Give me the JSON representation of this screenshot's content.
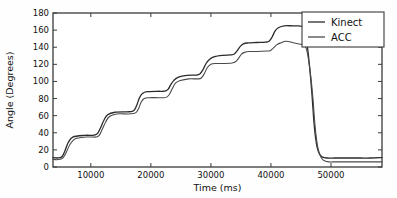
{
  "figure": {
    "background": "#fefefe",
    "axes_color": "#3a3a3a"
  },
  "chart_data": {
    "type": "line",
    "title": "",
    "xlabel": "Time (ms)",
    "ylabel": "Angle (Degrees)",
    "xlim": [
      3700,
      58500
    ],
    "ylim": [
      0,
      180
    ],
    "xticks": [
      10000,
      20000,
      30000,
      40000,
      50000
    ],
    "xtick_labels": [
      "10000",
      "20000",
      "30000",
      "40000",
      "50000"
    ],
    "yticks": [
      0,
      20,
      40,
      60,
      80,
      100,
      120,
      140,
      160,
      180
    ],
    "ytick_labels": [
      "0",
      "20",
      "40",
      "60",
      "80",
      "100",
      "120",
      "140",
      "160",
      "180"
    ],
    "grid": false,
    "legend_position": "upper right",
    "legend_entries": [
      "Kinect",
      "ACC"
    ],
    "series": [
      {
        "name": "Kinect",
        "color": "#2b2b2b",
        "width": 1.3,
        "x": [
          3700,
          4300,
          4900,
          5300,
          5700,
          6200,
          7000,
          9000,
          10200,
          10700,
          11200,
          11700,
          12200,
          12800,
          14000,
          16000,
          16900,
          17300,
          17700,
          18100,
          18600,
          19400,
          21000,
          22000,
          22500,
          22900,
          23300,
          23800,
          24600,
          26000,
          27600,
          28200,
          28700,
          29200,
          29800,
          30600,
          32000,
          33300,
          33900,
          34400,
          34900,
          35400,
          36200,
          37600,
          39100,
          39700,
          40200,
          40700,
          41300,
          42200,
          43600,
          44600,
          45100,
          45400,
          45700,
          46000,
          46400,
          46800,
          47100,
          47400,
          47700,
          48100,
          48600,
          49400,
          50600,
          52000,
          53500,
          55000,
          56500,
          58500
        ],
        "y": [
          11,
          10.5,
          11,
          13,
          19,
          28,
          35,
          37,
          37,
          37.5,
          40,
          47,
          55,
          61,
          64,
          64.5,
          65,
          67,
          73,
          81,
          86,
          88,
          88.5,
          88.5,
          89,
          91,
          96,
          101,
          105,
          107,
          107.5,
          109,
          114,
          121,
          126,
          129,
          130.5,
          131,
          132,
          136,
          141,
          144,
          145,
          145.5,
          146,
          147,
          152,
          159,
          163,
          165,
          165,
          165,
          164.5,
          163,
          158,
          145,
          120,
          88,
          58,
          36,
          23,
          15,
          11.5,
          10.5,
          10.5,
          10.5,
          10.5,
          10.5,
          10.5,
          11
        ],
        "final_value": 11
      },
      {
        "name": "ACC",
        "color": "#4a4a4a",
        "width": 1.1,
        "x": [
          3700,
          4300,
          4900,
          5400,
          5900,
          6500,
          7400,
          9200,
          10400,
          10900,
          11400,
          11900,
          12500,
          13100,
          14300,
          16200,
          17100,
          17600,
          18000,
          18400,
          18900,
          19700,
          21200,
          22200,
          22700,
          23100,
          23600,
          24100,
          24900,
          26300,
          27800,
          28400,
          28900,
          29400,
          30000,
          30800,
          32200,
          33500,
          34100,
          34600,
          35100,
          35600,
          36400,
          37800,
          39300,
          39900,
          40400,
          41000,
          41600,
          42500,
          43900,
          44900,
          45300,
          45600,
          45900,
          46200,
          46600,
          47000,
          47300,
          47600,
          47900,
          48300,
          48800,
          49600,
          50800,
          52200,
          53700,
          55200,
          56700,
          58500
        ],
        "y": [
          9,
          8.5,
          9,
          11,
          17,
          26,
          33,
          35,
          35,
          35,
          37,
          44,
          53,
          59,
          62,
          62,
          62.5,
          64,
          69,
          76,
          80,
          81,
          81,
          81,
          82,
          85,
          92,
          98,
          101,
          103,
          103,
          104,
          109,
          116,
          120,
          121,
          121,
          121.5,
          123,
          127,
          132,
          134,
          135,
          135,
          135.5,
          136,
          139,
          143,
          145,
          147,
          145,
          143.5,
          143,
          142,
          138,
          128,
          108,
          80,
          52,
          32,
          20,
          12,
          7.5,
          6,
          6,
          6,
          6,
          6,
          6,
          6
        ],
        "final_value": 6
      }
    ]
  }
}
